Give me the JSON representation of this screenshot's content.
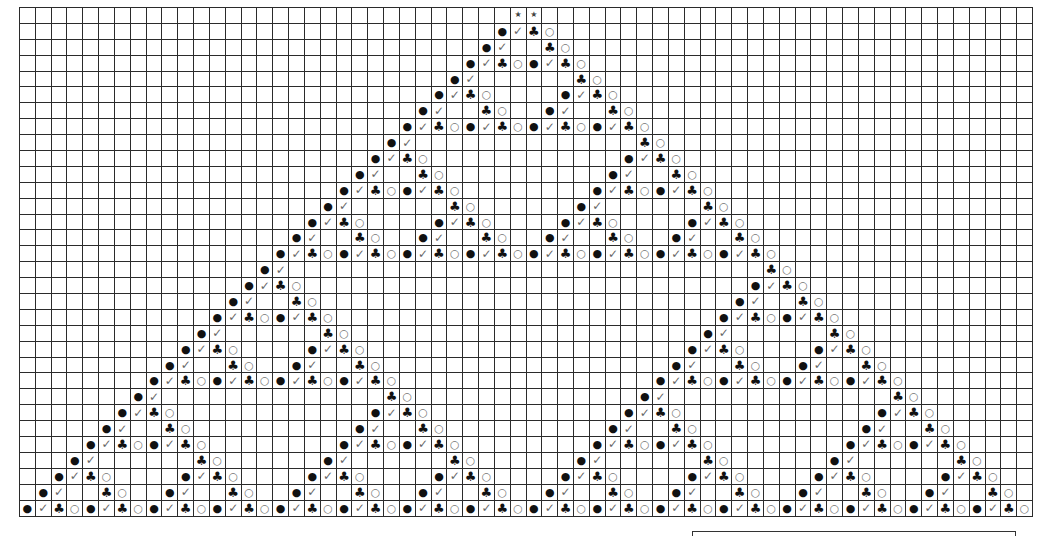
{
  "chart_title": "",
  "grid": {
    "columns": 64,
    "rows": 32,
    "line_color": "#2b2b2b",
    "background": "#ffffff"
  },
  "symbols": {
    "B": {
      "glyph": "●",
      "name": "filled-circle-icon",
      "color": "#111111"
    },
    "V": {
      "glyph": "✓",
      "name": "check-mark-icon",
      "color": "#666666"
    },
    "C": {
      "glyph": "♣",
      "name": "club-icon",
      "color": "#111111"
    },
    "O": {
      "glyph": "○",
      "name": "open-circle-icon",
      "color": "#777777"
    },
    "S": {
      "glyph": "★",
      "name": "star-icon",
      "color": "#444444"
    }
  },
  "cells": [
    [
      [
        31,
        "SS"
      ]
    ],
    [
      [
        30,
        "BVCO"
      ]
    ],
    [
      [
        29,
        "BV"
      ],
      [
        33,
        "CO"
      ]
    ],
    [
      [
        28,
        "BVCOBVCO"
      ]
    ],
    [
      [
        27,
        "BV"
      ],
      [
        35,
        "CO"
      ]
    ],
    [
      [
        26,
        "BVCO"
      ],
      [
        34,
        "BVCO"
      ]
    ],
    [
      [
        25,
        "BV"
      ],
      [
        29,
        "CO"
      ],
      [
        33,
        "BV"
      ],
      [
        37,
        "CO"
      ]
    ],
    [
      [
        24,
        "BVCOBVCOBVCOBVCO"
      ]
    ],
    [
      [
        23,
        "BV"
      ],
      [
        39,
        "CO"
      ]
    ],
    [
      [
        22,
        "BVCO"
      ],
      [
        38,
        "BVCO"
      ]
    ],
    [
      [
        21,
        "BV"
      ],
      [
        25,
        "CO"
      ],
      [
        37,
        "BV"
      ],
      [
        41,
        "CO"
      ]
    ],
    [
      [
        20,
        "BVCOBVCO"
      ],
      [
        36,
        "BVCOBVCO"
      ]
    ],
    [
      [
        19,
        "BV"
      ],
      [
        27,
        "CO"
      ],
      [
        35,
        "BV"
      ],
      [
        43,
        "CO"
      ]
    ],
    [
      [
        18,
        "BVCO"
      ],
      [
        26,
        "BVCO"
      ],
      [
        34,
        "BVCO"
      ],
      [
        42,
        "BVCO"
      ]
    ],
    [
      [
        17,
        "BV"
      ],
      [
        21,
        "CO"
      ],
      [
        25,
        "BV"
      ],
      [
        29,
        "CO"
      ],
      [
        33,
        "BV"
      ],
      [
        37,
        "CO"
      ],
      [
        41,
        "BV"
      ],
      [
        45,
        "CO"
      ]
    ],
    [
      [
        16,
        "BVCOBVCOBVCOBVCOBVCOBVCOBVCOBVCO"
      ]
    ],
    [
      [
        15,
        "BV"
      ],
      [
        47,
        "CO"
      ]
    ],
    [
      [
        14,
        "BVCO"
      ],
      [
        46,
        "BVCO"
      ]
    ],
    [
      [
        13,
        "BV"
      ],
      [
        17,
        "CO"
      ],
      [
        45,
        "BV"
      ],
      [
        49,
        "CO"
      ]
    ],
    [
      [
        12,
        "BVCOBVCO"
      ],
      [
        44,
        "BVCOBVCO"
      ]
    ],
    [
      [
        11,
        "BV"
      ],
      [
        19,
        "CO"
      ],
      [
        43,
        "BV"
      ],
      [
        51,
        "CO"
      ]
    ],
    [
      [
        10,
        "BVCO"
      ],
      [
        18,
        "BVCO"
      ],
      [
        42,
        "BVCO"
      ],
      [
        50,
        "BVCO"
      ]
    ],
    [
      [
        9,
        "BV"
      ],
      [
        13,
        "CO"
      ],
      [
        17,
        "BV"
      ],
      [
        21,
        "CO"
      ],
      [
        41,
        "BV"
      ],
      [
        45,
        "CO"
      ],
      [
        49,
        "BV"
      ],
      [
        53,
        "CO"
      ]
    ],
    [
      [
        8,
        "BVCOBVCOBVCOBVCO"
      ],
      [
        40,
        "BVCOBVCOBVCOBVCO"
      ]
    ],
    [
      [
        7,
        "BV"
      ],
      [
        23,
        "CO"
      ],
      [
        39,
        "BV"
      ],
      [
        55,
        "CO"
      ]
    ],
    [
      [
        6,
        "BVCO"
      ],
      [
        22,
        "BVCO"
      ],
      [
        38,
        "BVCO"
      ],
      [
        54,
        "BVCO"
      ]
    ],
    [
      [
        5,
        "BV"
      ],
      [
        9,
        "CO"
      ],
      [
        21,
        "BV"
      ],
      [
        25,
        "CO"
      ],
      [
        37,
        "BV"
      ],
      [
        41,
        "CO"
      ],
      [
        53,
        "BV"
      ],
      [
        57,
        "CO"
      ]
    ],
    [
      [
        4,
        "BVCOBVCO"
      ],
      [
        20,
        "BVCOBVCO"
      ],
      [
        36,
        "BVCOBVCO"
      ],
      [
        52,
        "BVCOBVCO"
      ]
    ],
    [
      [
        3,
        "BV"
      ],
      [
        11,
        "CO"
      ],
      [
        19,
        "BV"
      ],
      [
        27,
        "CO"
      ],
      [
        35,
        "BV"
      ],
      [
        43,
        "CO"
      ],
      [
        51,
        "BV"
      ],
      [
        59,
        "CO"
      ]
    ],
    [
      [
        2,
        "BVCO"
      ],
      [
        10,
        "BVCO"
      ],
      [
        18,
        "BVCO"
      ],
      [
        26,
        "BVCO"
      ],
      [
        34,
        "BVCO"
      ],
      [
        42,
        "BVCO"
      ],
      [
        50,
        "BVCO"
      ],
      [
        58,
        "BVCO"
      ]
    ],
    [
      [
        1,
        "BV"
      ],
      [
        5,
        "CO"
      ],
      [
        9,
        "BV"
      ],
      [
        13,
        "CO"
      ],
      [
        17,
        "BV"
      ],
      [
        21,
        "CO"
      ],
      [
        25,
        "BV"
      ],
      [
        29,
        "CO"
      ],
      [
        33,
        "BV"
      ],
      [
        37,
        "CO"
      ],
      [
        41,
        "BV"
      ],
      [
        45,
        "CO"
      ],
      [
        49,
        "BV"
      ],
      [
        53,
        "CO"
      ],
      [
        57,
        "BV"
      ],
      [
        61,
        "CO"
      ]
    ],
    [
      [
        0,
        "BVCOBVCOBVCOBVCOBVCOBVCOBVCOBVCOBVCOBVCOBVCOBVCOBVCOBVCOBVCOBVCO"
      ]
    ]
  ],
  "legend_box": {
    "text": ""
  }
}
